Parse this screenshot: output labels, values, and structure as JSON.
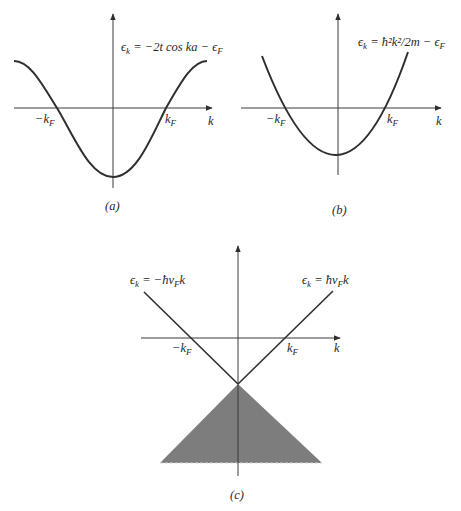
{
  "figure": {
    "panels": [
      {
        "id": "a",
        "caption": "(a)",
        "equation": "ϵk = −2t cos ka − ϵF",
        "equation_parts": {
          "lhs": "ϵ",
          "lhs_sub": "k",
          "rhs": " = −2t cos ka − ϵ",
          "rhs_sub": "F"
        },
        "x_axis_label": "k",
        "tick_left": {
          "main": "−k",
          "sub": "F"
        },
        "tick_right": {
          "main": "k",
          "sub": "F"
        },
        "curve": "cosine band"
      },
      {
        "id": "b",
        "caption": "(b)",
        "equation": "ϵk = ħ²k²/2m − ϵF",
        "equation_parts": {
          "lhs": "ϵ",
          "lhs_sub": "k",
          "rhs": " = ħ²k²/2m − ϵ",
          "rhs_sub": "F"
        },
        "x_axis_label": "k",
        "tick_left": {
          "main": "−k",
          "sub": "F"
        },
        "tick_right": {
          "main": "k",
          "sub": "F"
        },
        "curve": "parabola"
      },
      {
        "id": "c",
        "caption": "(c)",
        "equation_left": "ϵk = −ħvFk",
        "equation_left_parts": {
          "lhs": "ϵ",
          "lhs_sub": "k",
          "mid": " = −ħv",
          "mid_sub": "F",
          "tail": "k"
        },
        "equation_right": "ϵk = ħvFk",
        "equation_right_parts": {
          "lhs": "ϵ",
          "lhs_sub": "k",
          "mid": " = ħv",
          "mid_sub": "F",
          "tail": "k"
        },
        "x_axis_label": "k",
        "tick_left": {
          "main": "−k",
          "sub": "F"
        },
        "tick_right": {
          "main": "k",
          "sub": "F"
        },
        "curve": "linear (Dirac cone) with filled triangle below vertex",
        "fill_color": "#7d7d7d"
      }
    ],
    "colors": {
      "line": "#2f2f2f",
      "fill": "#7d7d7d",
      "background": "#ffffff"
    }
  }
}
